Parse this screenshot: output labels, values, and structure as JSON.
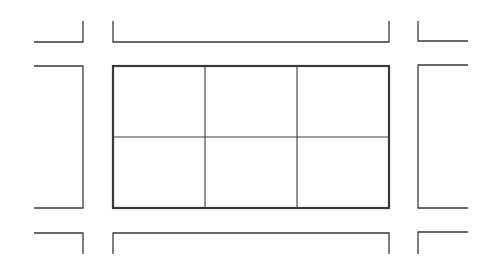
{
  "diagram": {
    "title": "",
    "stroke_color": "#3a3a3a",
    "background": "#ffffff",
    "central_block": {
      "x": 113,
      "y": 66,
      "width": 276,
      "height": 142,
      "rows": 2,
      "cols": 3,
      "border_width": 2.2,
      "divider_width": 1.1,
      "col_dividers_x": [
        205,
        297
      ],
      "row_divider_y": 137
    },
    "surrounding_blocks": [
      {
        "name": "top-left-block",
        "path": "M34,42 L83,42 L83,21"
      },
      {
        "name": "top-middle-block",
        "path": "M113,21 L113,42 L389,42 L389,21"
      },
      {
        "name": "top-right-block",
        "path": "M418,21 L418,41 L468,41"
      },
      {
        "name": "middle-left-block",
        "path": "M34,66 L83,66 L83,208 L34,208"
      },
      {
        "name": "middle-right-block",
        "path": "M468,65 L418,65 L418,208 L468,208"
      },
      {
        "name": "bottom-left-block",
        "path": "M34,233 L83,233 L83,254"
      },
      {
        "name": "bottom-middle-block",
        "path": "M113,254 L113,233 L389,233 L389,254"
      },
      {
        "name": "bottom-right-block",
        "path": "M418,254 L418,232 L468,232"
      }
    ]
  }
}
